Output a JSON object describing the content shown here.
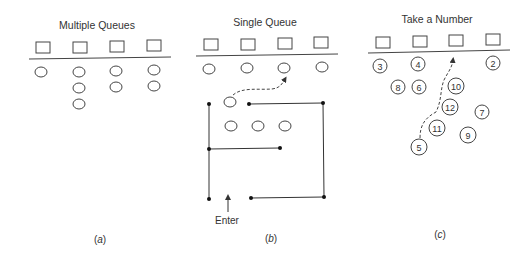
{
  "figure": {
    "panels": [
      {
        "id": "a",
        "title": "Multiple Queues",
        "caption_open": "(",
        "caption_letter": "a",
        "caption_close": ")"
      },
      {
        "id": "b",
        "title": "Single Queue",
        "caption_open": "(",
        "caption_letter": "b",
        "caption_close": ")",
        "enter_label": "Enter"
      },
      {
        "id": "c",
        "title": "Take a Number",
        "caption_open": "(",
        "caption_letter": "c",
        "caption_close": ")",
        "tickets": [
          "3",
          "4",
          "2",
          "8",
          "6",
          "10",
          "12",
          "7",
          "11",
          "9",
          "5"
        ]
      }
    ],
    "colors": {
      "stroke": "#444444",
      "text": "#333333",
      "background": "#ffffff"
    }
  }
}
